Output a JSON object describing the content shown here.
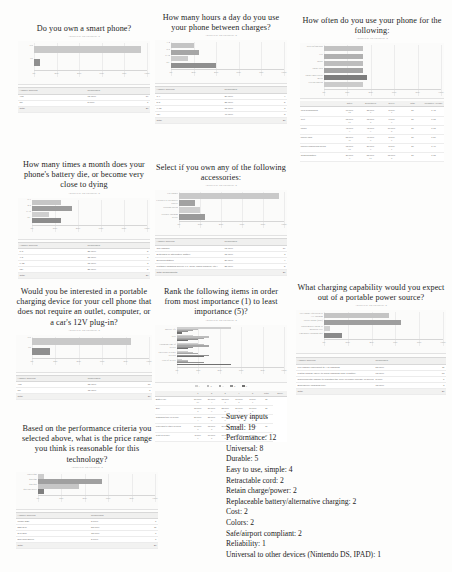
{
  "document": {
    "kind": "survey-results-report-page",
    "page_background": "#fdfdfc",
    "bar_color_light": "#c9c9c9",
    "bar_color_dark": "#8a8a8a"
  },
  "panels": {
    "q1": {
      "title": "Do you own a smart phone?",
      "subtitle": "Answered: 20    Skipped: 0",
      "table_headers": [
        "Answer Choices",
        "Responses",
        ""
      ],
      "rows": [
        {
          "label": "Yes",
          "pct": "95.00%",
          "count": "19"
        },
        {
          "label": "No",
          "pct": "5.00%",
          "count": "1"
        }
      ],
      "total_label": "Total",
      "total_count": "20"
    },
    "q2": {
      "title": "How many hours a day do you use your phone between charges?",
      "subtitle": "Answered: 20    Skipped: 0",
      "table_headers": [
        "Answer Choices",
        "Responses",
        ""
      ],
      "rows": [
        {
          "label": "1-4",
          "pct": "20.00%",
          "count": "4"
        },
        {
          "label": "5-8",
          "pct": "25.00%",
          "count": "5"
        },
        {
          "label": "9-12",
          "pct": "15.00%",
          "count": "3"
        },
        {
          "label": "12+",
          "pct": "40.00%",
          "count": "8"
        }
      ],
      "total_label": "Total",
      "total_count": "20"
    },
    "q3": {
      "title": "How often do you use your phone for the following:",
      "subtitle": "Answered: 20    Skipped: 0",
      "categories": [
        "Web surfing/apps",
        "Text",
        "Music",
        "Phone calls",
        "Phone/email/social media",
        "GPS/navigation"
      ],
      "matrix_headers": [
        "",
        "Often",
        "Sometimes",
        "Never",
        "Total",
        "Weighted Average"
      ],
      "matrix_rows": [
        {
          "label": "Web surfing/apps",
          "c": [
            "60.00%\n12",
            "35.00%\n7",
            "5.00%\n1",
            "20",
            "1.45"
          ]
        },
        {
          "label": "Text",
          "c": [
            "85.00%\n17",
            "15.00%\n3",
            "0.00%\n0",
            "20",
            "1.15"
          ]
        },
        {
          "label": "Music",
          "c": [
            "45.00%\n9",
            "45.00%\n9",
            "10.00%\n2",
            "20",
            "1.65"
          ]
        },
        {
          "label": "Phone calls",
          "c": [
            "55.00%\n11",
            "40.00%\n8",
            "5.00%\n1",
            "20",
            "1.50"
          ]
        },
        {
          "label": "Phone/email/social media",
          "c": [
            "65.00%\n13",
            "30.00%\n6",
            "5.00%\n1",
            "20",
            "1.40"
          ]
        },
        {
          "label": "GPS/navigation",
          "c": [
            "30.00%\n6",
            "55.00%\n11",
            "15.00%\n3",
            "20",
            "1.85"
          ]
        }
      ]
    },
    "q4": {
      "title": "How many times a month does your phone's battery die, or become very close to dying",
      "subtitle": "Answered: 20    Skipped: 0",
      "table_headers": [
        "Answer Choices",
        "Responses",
        ""
      ],
      "rows": [
        {
          "label": "0-3",
          "pct": "25.00%",
          "count": "5"
        },
        {
          "label": "4-8",
          "pct": "35.00%",
          "count": "7"
        },
        {
          "label": "9-12",
          "pct": "15.00%",
          "count": "3"
        },
        {
          "label": "12+",
          "pct": "25.00%",
          "count": "5"
        }
      ],
      "total_label": "Total",
      "total_count": "20"
    },
    "q5": {
      "title": "Select if you own any of the following accessories:",
      "subtitle": "Answered: 20    Skipped: 0",
      "table_headers": [
        "Answer Choices",
        "Responses",
        ""
      ],
      "rows": [
        {
          "label": "Car charger",
          "pct": "95.00%",
          "count": "19"
        },
        {
          "label": "Extended or alternative battery",
          "pct": "15.00%",
          "count": "3"
        },
        {
          "label": "Docking station",
          "pct": "20.00%",
          "count": "4"
        },
        {
          "label": "Portable charging device (i.e. solar, hand cranked, etc.)",
          "pct": "25.00%",
          "count": "5"
        }
      ],
      "total_label": "Total Respondents",
      "total_count": "20"
    },
    "q6": {
      "title": "Would you be interested in a portable charging device for your cell phone that does not require an outlet, computer, or a car's 12V plug-in?",
      "subtitle": "Answered: 20    Skipped: 0",
      "table_headers": [
        "Answer Choices",
        "Responses",
        ""
      ],
      "rows": [
        {
          "label": "Yes",
          "pct": "85.00%",
          "count": "17"
        },
        {
          "label": "No",
          "pct": "15.00%",
          "count": "3"
        }
      ],
      "total_label": "Total",
      "total_count": "20"
    },
    "q7": {
      "title": "Rank the following items in order from most importance (1) to least importance (5)?",
      "subtitle": "Answered: 20    Skipped: 0",
      "categories": [
        "Battery life",
        "Size",
        "Charging time of device",
        "Universal to other devices",
        "Cost of device"
      ],
      "legend": [
        "1",
        "2",
        "3",
        "4",
        "5"
      ],
      "matrix_headers": [
        "",
        "1",
        "2",
        "3",
        "4",
        "5",
        "Total",
        "Score"
      ],
      "matrix_rows": [
        {
          "label": "Battery life",
          "c": [
            "50.00%\n10",
            "20.00%\n4",
            "15.00%\n3",
            "10.00%\n2",
            "5.00%\n1",
            "20"
          ]
        },
        {
          "label": "Size",
          "c": [
            "15.00%\n3",
            "30.00%\n6",
            "25.00%\n5",
            "20.00%\n4",
            "10.00%\n2",
            "20"
          ]
        },
        {
          "label": "Charging time of device",
          "c": [
            "20.00%\n4",
            "25.00%\n5",
            "30.00%\n6",
            "15.00%\n3",
            "10.00%\n2",
            "20"
          ]
        },
        {
          "label": "Universal to other devices",
          "c": [
            "10.00%\n2",
            "15.00%\n3",
            "20.00%\n4",
            "30.00%\n6",
            "25.00%\n5",
            "20"
          ]
        },
        {
          "label": "Cost of device",
          "c": [
            "5.00%\n1",
            "10.00%\n2",
            "10.00%\n2",
            "25.00%\n5",
            "50.00%\n10",
            "20"
          ]
        }
      ]
    },
    "q8": {
      "title": "What charging capability would you expect out of a portable power source?",
      "subtitle": "Answered: 20    Skipped: 0",
      "table_headers": [
        "Answer Choices",
        "Responses",
        ""
      ],
      "rows": [
        {
          "label": "Full charge equivalent to A/C charging",
          "pct": "55.00%",
          "count": "11"
        },
        {
          "label": "Partial charge (50%) to allow charging from a battery",
          "pct": "65.00%",
          "count": "13"
        },
        {
          "label": "Supplemental charge to maintain the level of power already in device",
          "pct": "5.00%",
          "count": "1"
        },
        {
          "label": "Emergency charging only",
          "pct": "15.00%",
          "count": "3"
        }
      ],
      "total_label": "Total",
      "total_count": "20"
    },
    "q9": {
      "title": "Based on the performance criteria you selected above, what is the price range you think is reasonable for this technology?",
      "subtitle": "Answered: 20    Skipped: 0",
      "table_headers": [
        "Answer Choices",
        "Responses",
        ""
      ],
      "rows": [
        {
          "label": "Under $20",
          "pct": "5.00%",
          "count": "1"
        },
        {
          "label": "$20-$40",
          "pct": "55.00%",
          "count": "11"
        },
        {
          "label": "$40-$60",
          "pct": "35.00%",
          "count": "7"
        },
        {
          "label": "$60 and above",
          "pct": "5.00%",
          "count": "1"
        }
      ],
      "total_label": "Total",
      "total_count": "20"
    }
  },
  "survey_inputs": {
    "heading": "Survey inputs",
    "items": [
      "Small: 19",
      "Performance: 12",
      "Universal: 8",
      "Durable: 5",
      "Easy to use, simple: 4",
      "Retractable cord: 2",
      "Retain charge/power: 2",
      "Replaceable battery/alternative charging: 2",
      "Cost: 2",
      "Colors: 2",
      "Safe/airport compliant: 2",
      "Reliability: 1",
      "Universal to other devices (Nintendo DS, IPAD): 1"
    ]
  },
  "chart_data": [
    {
      "id": "q1",
      "type": "bar",
      "orientation": "horizontal",
      "title": "Do you own a smart phone?",
      "categories": [
        "Yes",
        "No"
      ],
      "values": [
        95,
        5
      ],
      "colors": [
        "#c9c9c9",
        "#8f8f8f"
      ],
      "xlabel": "",
      "ylabel": "",
      "xlim": [
        0,
        100
      ],
      "xticks": [
        "0%",
        "20%",
        "40%",
        "60%",
        "80%",
        "100%"
      ],
      "grid": true
    },
    {
      "id": "q2",
      "type": "bar",
      "orientation": "horizontal",
      "title": "How many hours a day do you use your phone between charges?",
      "categories": [
        "1-4",
        "5-8",
        "9-12",
        "12+"
      ],
      "values": [
        20,
        25,
        15,
        40
      ],
      "colors": [
        "#c4c4c4",
        "#a6a6a6",
        "#cccccc",
        "#8f8f8f"
      ],
      "xlim": [
        0,
        100
      ],
      "xticks": [
        "0%",
        "20%",
        "40%",
        "60%",
        "80%",
        "100%"
      ],
      "grid": true
    },
    {
      "id": "q3",
      "type": "bar",
      "orientation": "horizontal",
      "title": "How often do you use your phone for the following:",
      "categories": [
        "Web surfing/apps",
        "Text",
        "Music",
        "Phone calls",
        "Phone/email/social media",
        "GPS/navigation"
      ],
      "values": [
        60,
        85,
        45,
        55,
        65,
        30
      ],
      "bar_len_pct": [
        33,
        33,
        33,
        33,
        37,
        33
      ],
      "colors": [
        "#c2c2c2",
        "#b0b0b0",
        "#bdbdbd",
        "#a3a3a3",
        "#7d7d7d",
        "#cbcbcb"
      ],
      "xlim": [
        0,
        100
      ],
      "xticks": [
        "0%",
        "20%",
        "40%",
        "60%",
        "80%",
        "100%"
      ],
      "grid": true
    },
    {
      "id": "q4",
      "type": "bar",
      "orientation": "horizontal",
      "title": "How many times a month does your phone's battery die, or become very close to dying",
      "categories": [
        "0-3",
        "4-8",
        "9-12",
        "12+"
      ],
      "values": [
        25,
        35,
        15,
        25
      ],
      "colors": [
        "#c6c6c6",
        "#9c9c9c",
        "#cfcfcf",
        "#8c8c8c"
      ],
      "xlim": [
        0,
        100
      ],
      "xticks": [
        "0%",
        "20%",
        "40%",
        "60%",
        "80%",
        "100%"
      ],
      "grid": true
    },
    {
      "id": "q5",
      "type": "bar",
      "orientation": "horizontal",
      "title": "Select if you own any of the following accessories:",
      "categories": [
        "Car charger",
        "Extended or alternative battery",
        "Docking station",
        "Portable charging device"
      ],
      "values": [
        95,
        15,
        20,
        25
      ],
      "colors": [
        "#c9c9c9",
        "#a2a2a2",
        "#cfcfcf",
        "#9a9a9a"
      ],
      "xlim": [
        0,
        100
      ],
      "xticks": [
        "0%",
        "20%",
        "40%",
        "60%",
        "80%",
        "100%"
      ],
      "grid": true
    },
    {
      "id": "q6",
      "type": "bar",
      "orientation": "horizontal",
      "title": "Would you be interested in a portable charging device for your cell phone that does not require an outlet, computer, or a car's 12V plug-in?",
      "categories": [
        "Yes",
        "No"
      ],
      "values": [
        85,
        15
      ],
      "colors": [
        "#c9c9c9",
        "#8f8f8f"
      ],
      "xlim": [
        0,
        100
      ],
      "xticks": [
        "0%",
        "20%",
        "40%",
        "60%",
        "80%",
        "100%"
      ],
      "grid": true
    },
    {
      "id": "q7",
      "type": "bar",
      "orientation": "horizontal-grouped",
      "title": "Rank the following items in order from most importance (1) to least importance (5)?",
      "categories": [
        "Battery life",
        "Size",
        "Charging time of device",
        "Universal to other devices",
        "Cost of device"
      ],
      "legend": [
        "1",
        "2",
        "3",
        "4",
        "5"
      ],
      "series": [
        {
          "name": "1",
          "values": [
            50,
            15,
            20,
            10,
            5
          ]
        },
        {
          "name": "2",
          "values": [
            20,
            30,
            25,
            15,
            10
          ]
        },
        {
          "name": "3",
          "values": [
            15,
            25,
            30,
            20,
            10
          ]
        },
        {
          "name": "4",
          "values": [
            10,
            20,
            15,
            30,
            25
          ]
        },
        {
          "name": "5",
          "values": [
            5,
            10,
            10,
            25,
            50
          ]
        }
      ],
      "xlim": [
        0,
        100
      ],
      "xticks": [
        "0%",
        "20%",
        "40%",
        "60%",
        "80%",
        "100%"
      ],
      "grid": true
    },
    {
      "id": "q8",
      "type": "bar",
      "orientation": "horizontal",
      "title": "What charging capability would you expect out of a portable power source?",
      "categories": [
        "Full charge equivalent to A/C charging",
        "Partial charge (50%)",
        "Supplemental charge to maintain level",
        "Emergency charging only"
      ],
      "values": [
        55,
        65,
        5,
        15
      ],
      "colors": [
        "#c4c4c4",
        "#9e9e9e",
        "#d2d2d2",
        "#8a8a8a"
      ],
      "xlim": [
        0,
        100
      ],
      "xticks": [
        "0%",
        "20%",
        "40%",
        "60%",
        "80%",
        "100%"
      ],
      "grid": true
    },
    {
      "id": "q9",
      "type": "bar",
      "orientation": "horizontal",
      "title": "Based on the performance criteria you selected above, what is the price range you think is reasonable for this technology?",
      "categories": [
        "Under $20",
        "$20-$40",
        "$40-$60",
        "$60 and above"
      ],
      "values": [
        5,
        55,
        35,
        5
      ],
      "colors": [
        "#cdcdcd",
        "#a0a0a0",
        "#c6c6c6",
        "#7f7f7f"
      ],
      "xlim": [
        0,
        100
      ],
      "xticks": [
        "0%",
        "20%",
        "40%",
        "60%",
        "80%",
        "100%"
      ],
      "grid": true
    }
  ]
}
